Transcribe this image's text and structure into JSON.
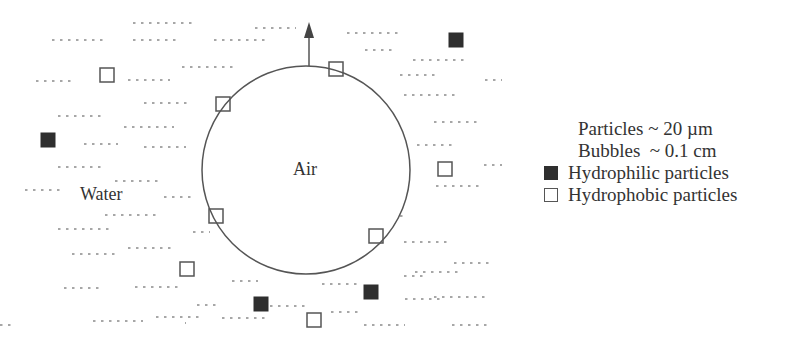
{
  "diagram": {
    "medium_label": "Water",
    "bubble_label": "Air",
    "colors": {
      "line": "#555555",
      "dash": "#888888",
      "filled": "#2f2f2f"
    },
    "bubble": {
      "cx": 306,
      "cy": 170,
      "r": 104
    },
    "arrow": {
      "x": 309,
      "y1": 66,
      "y2": 22
    },
    "hydrophilic_particles": [
      {
        "x": 449,
        "y": 33
      },
      {
        "x": 41,
        "y": 133
      },
      {
        "x": 254,
        "y": 297
      },
      {
        "x": 364,
        "y": 285
      }
    ],
    "hydrophobic_particles": [
      {
        "x": 100,
        "y": 68
      },
      {
        "x": 329,
        "y": 62
      },
      {
        "x": 216,
        "y": 97
      },
      {
        "x": 438,
        "y": 162
      },
      {
        "x": 209,
        "y": 209
      },
      {
        "x": 369,
        "y": 229
      },
      {
        "x": 180,
        "y": 262
      },
      {
        "x": 307,
        "y": 313
      }
    ]
  },
  "legend": {
    "particle_size": "Particles ~ 20 µm",
    "bubble_size": "Bubbles  ~ 0.1 cm",
    "hydrophilic_label": "Hydrophilic particles",
    "hydrophobic_label": "Hydrophobic particles"
  }
}
